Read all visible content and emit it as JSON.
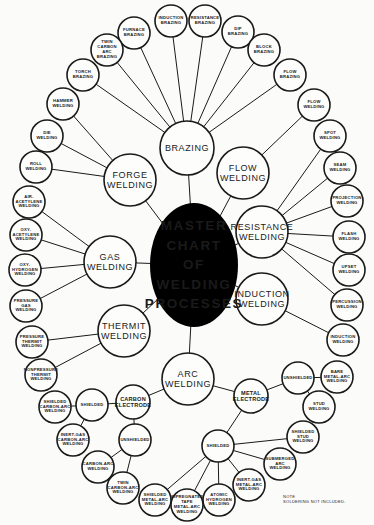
{
  "title": "MASTER\nCHART\nOF\nWELDING\nPROCESSES",
  "note": "NOTE\n   SOLDERING NOT INCLUDED.",
  "nodes": [
    {
      "id": "center",
      "label": "MASTER\nCHART\nOF\nWELDING\nPROCESSES",
      "x": 194,
      "y": 265,
      "rx": 44,
      "ry": 62,
      "type": "center"
    },
    {
      "id": "brazing",
      "label": "BRAZING",
      "x": 187,
      "y": 148,
      "r": 27,
      "type": "mid"
    },
    {
      "id": "forge",
      "label": "FORGE\nWELDING",
      "x": 130,
      "y": 180,
      "r": 26,
      "type": "mid"
    },
    {
      "id": "flow",
      "label": "FLOW\nWELDING",
      "x": 243,
      "y": 173,
      "r": 26,
      "type": "mid"
    },
    {
      "id": "gas",
      "label": "GAS\nWELDING",
      "x": 110,
      "y": 262,
      "r": 26,
      "type": "mid"
    },
    {
      "id": "resistance",
      "label": "RESISTANCE\nWELDING",
      "x": 262,
      "y": 232,
      "r": 26,
      "type": "mid"
    },
    {
      "id": "thermit",
      "label": "THERMIT\nWELDING",
      "x": 124,
      "y": 331,
      "r": 26,
      "type": "mid"
    },
    {
      "id": "induction",
      "label": "INDUCTION\nWELDING",
      "x": 262,
      "y": 299,
      "r": 26,
      "type": "mid"
    },
    {
      "id": "arc",
      "label": "ARC\nWELDING",
      "x": 188,
      "y": 379,
      "r": 26,
      "type": "mid"
    },
    {
      "id": "carbon_electrode",
      "label": "CARBON\nELECTRODE",
      "x": 133,
      "y": 402,
      "r": 17,
      "type": "small_mid"
    },
    {
      "id": "metal_electrode",
      "label": "METAL\nELECTRODE",
      "x": 251,
      "y": 396,
      "r": 17,
      "type": "small_mid"
    },
    {
      "id": "furnace_brazing",
      "label": "FURNACE\nBRAZING",
      "x": 134,
      "y": 33,
      "r": 16,
      "type": "leaf"
    },
    {
      "id": "induction_brazing",
      "label": "INDUCTION\nBRAZING",
      "x": 171,
      "y": 21,
      "r": 16,
      "type": "leaf"
    },
    {
      "id": "resistance_brazing",
      "label": "RESISTANCE\nBRAZING",
      "x": 205,
      "y": 21,
      "r": 16,
      "type": "leaf"
    },
    {
      "id": "dip_brazing",
      "label": "DIP\nBRAZING",
      "x": 238,
      "y": 32,
      "r": 16,
      "type": "leaf"
    },
    {
      "id": "block_brazing",
      "label": "BLOCK\nBRAZING",
      "x": 264,
      "y": 50,
      "r": 16,
      "type": "leaf"
    },
    {
      "id": "flow_brazing",
      "label": "FLOW\nBRAZING",
      "x": 290,
      "y": 75,
      "r": 16,
      "type": "leaf"
    },
    {
      "id": "twin_carbon_arc_brazing",
      "label": "TWIN CARBON\nARC\nBRAZING",
      "x": 107,
      "y": 50,
      "r": 16,
      "type": "leaf"
    },
    {
      "id": "torch_brazing",
      "label": "TORCH\nBRAZING",
      "x": 83,
      "y": 75,
      "r": 16,
      "type": "leaf"
    },
    {
      "id": "hammer_welding",
      "label": "HAMMER\nWELDING",
      "x": 63,
      "y": 104,
      "r": 16,
      "type": "leaf"
    },
    {
      "id": "die_welding",
      "label": "DIE\nWELDING",
      "x": 47,
      "y": 136,
      "r": 16,
      "type": "leaf"
    },
    {
      "id": "roll_welding",
      "label": "ROLL\nWELDING",
      "x": 36,
      "y": 167,
      "r": 16,
      "type": "leaf"
    },
    {
      "id": "air_acetylene_welding",
      "label": "AIR-\nACETYLENE\nWELDING",
      "x": 29,
      "y": 202,
      "r": 16,
      "type": "leaf"
    },
    {
      "id": "oxy_acetylene_welding",
      "label": "OXY-\nACETYLENE\nWELDING",
      "x": 26,
      "y": 235,
      "r": 16,
      "type": "leaf"
    },
    {
      "id": "oxy_hydrogen_welding",
      "label": "OXY-\nHYDROGEN\nWELDING",
      "x": 25,
      "y": 270,
      "r": 16,
      "type": "leaf"
    },
    {
      "id": "pressure_gas_welding",
      "label": "PRESSURE\nGAS\nWELDING",
      "x": 26,
      "y": 306,
      "r": 16,
      "type": "leaf"
    },
    {
      "id": "pressure_thermit_welding",
      "label": "PRESSURE\nTHERMIT\nWELDING",
      "x": 32,
      "y": 342,
      "r": 16,
      "type": "leaf"
    },
    {
      "id": "nonpressure_thermit_welding",
      "label": "NONPRESSURE\nTHERMIT\nWELDING",
      "x": 41,
      "y": 375,
      "r": 16,
      "type": "leaf"
    },
    {
      "id": "flow_welding_leaf",
      "label": "FLOW\nWELDING",
      "x": 314,
      "y": 105,
      "r": 16,
      "type": "leaf"
    },
    {
      "id": "spot_welding",
      "label": "SPOT\nWELDING",
      "x": 330,
      "y": 136,
      "r": 16,
      "type": "leaf"
    },
    {
      "id": "seam_welding",
      "label": "SEAM\nWELDING",
      "x": 340,
      "y": 168,
      "r": 16,
      "type": "leaf"
    },
    {
      "id": "projection_welding",
      "label": "PROJECTION\nWELDING",
      "x": 347,
      "y": 201,
      "r": 16,
      "type": "leaf"
    },
    {
      "id": "flash_welding",
      "label": "FLASH\nWELDING",
      "x": 349,
      "y": 237,
      "r": 16,
      "type": "leaf"
    },
    {
      "id": "upset_welding",
      "label": "UPSET\nWELDING",
      "x": 349,
      "y": 270,
      "r": 16,
      "type": "leaf"
    },
    {
      "id": "percussion_welding",
      "label": "PERCUSSION\nWELDING",
      "x": 347,
      "y": 305,
      "r": 16,
      "type": "leaf"
    },
    {
      "id": "induction_welding_leaf",
      "label": "INDUCTION\nWELDING",
      "x": 343,
      "y": 340,
      "r": 16,
      "type": "leaf"
    },
    {
      "id": "unshielded_metal",
      "label": "UNSHIELDED",
      "x": 298,
      "y": 378,
      "r": 16,
      "type": "leaf"
    },
    {
      "id": "bare_metal_arc_welding",
      "label": "BARE\nMETAL-ARC\nWELDING",
      "x": 337,
      "y": 377,
      "r": 16,
      "type": "leaf"
    },
    {
      "id": "stud_welding",
      "label": "STUD\nWELDING",
      "x": 319,
      "y": 407,
      "r": 16,
      "type": "leaf"
    },
    {
      "id": "shielded_metal",
      "label": "SHIELDED",
      "x": 218,
      "y": 446,
      "r": 16,
      "type": "leaf"
    },
    {
      "id": "shielded_stud_welding",
      "label": "SHIELDED\nSTUD\nWELDING",
      "x": 303,
      "y": 437,
      "r": 16,
      "type": "leaf"
    },
    {
      "id": "submerged_arc_welding",
      "label": "SUBMERGED\nARC\nWELDING",
      "x": 280,
      "y": 464,
      "r": 16,
      "type": "leaf"
    },
    {
      "id": "inert_gas_metal_arc_welding",
      "label": "INERT-GAS\nMETAL-ARC\nWELDING",
      "x": 249,
      "y": 485,
      "r": 16,
      "type": "leaf"
    },
    {
      "id": "atomic_hydrogen_welding",
      "label": "ATOMIC\nHYDROGEN\nWELDING",
      "x": 219,
      "y": 500,
      "r": 16,
      "type": "leaf"
    },
    {
      "id": "impregnated_tape_metal_arc_welding",
      "label": "IMPREGNATED\nTAPE\nMETAL-ARC\nWELDING",
      "x": 187,
      "y": 505,
      "r": 16,
      "type": "leaf"
    },
    {
      "id": "shielded_metal_arc_welding",
      "label": "SHIELDED\nMETAL-ARC\nWELDING",
      "x": 155,
      "y": 500,
      "r": 16,
      "type": "leaf"
    },
    {
      "id": "shielded_carbon",
      "label": "SHIELDED",
      "x": 92,
      "y": 405,
      "r": 16,
      "type": "leaf"
    },
    {
      "id": "shielded_carbon_arc_welding",
      "label": "SHIELDED\nCARBON-ARC\nWELDING",
      "x": 55,
      "y": 407,
      "r": 16,
      "type": "leaf"
    },
    {
      "id": "inert_gas_carbon_arc_welding",
      "label": "INERT-GAS\nCARBON-ARC\nWELDING",
      "x": 73,
      "y": 440,
      "r": 16,
      "type": "leaf"
    },
    {
      "id": "unshielded_carbon",
      "label": "UNSHIELDED",
      "x": 135,
      "y": 440,
      "r": 16,
      "type": "leaf"
    },
    {
      "id": "carbon_arc_welding",
      "label": "CARBON-ARC\nWELDING",
      "x": 98,
      "y": 467,
      "r": 16,
      "type": "leaf"
    },
    {
      "id": "twin_carbon_arc_welding",
      "label": "TWIN\nCARBON-ARC\nWELDING",
      "x": 123,
      "y": 488,
      "r": 16,
      "type": "leaf"
    }
  ],
  "edges": [
    [
      "center",
      "brazing"
    ],
    [
      "center",
      "forge"
    ],
    [
      "center",
      "flow"
    ],
    [
      "center",
      "gas"
    ],
    [
      "center",
      "resistance"
    ],
    [
      "center",
      "thermit"
    ],
    [
      "center",
      "induction"
    ],
    [
      "center",
      "arc"
    ],
    [
      "brazing",
      "furnace_brazing"
    ],
    [
      "brazing",
      "induction_brazing"
    ],
    [
      "brazing",
      "resistance_brazing"
    ],
    [
      "brazing",
      "dip_brazing"
    ],
    [
      "brazing",
      "block_brazing"
    ],
    [
      "brazing",
      "flow_brazing"
    ],
    [
      "brazing",
      "twin_carbon_arc_brazing"
    ],
    [
      "brazing",
      "torch_brazing"
    ],
    [
      "forge",
      "hammer_welding"
    ],
    [
      "forge",
      "die_welding"
    ],
    [
      "forge",
      "roll_welding"
    ],
    [
      "gas",
      "air_acetylene_welding"
    ],
    [
      "gas",
      "oxy_acetylene_welding"
    ],
    [
      "gas",
      "oxy_hydrogen_welding"
    ],
    [
      "gas",
      "pressure_gas_welding"
    ],
    [
      "thermit",
      "pressure_thermit_welding"
    ],
    [
      "thermit",
      "nonpressure_thermit_welding"
    ],
    [
      "flow",
      "flow_welding_leaf"
    ],
    [
      "resistance",
      "spot_welding"
    ],
    [
      "resistance",
      "seam_welding"
    ],
    [
      "resistance",
      "projection_welding"
    ],
    [
      "resistance",
      "flash_welding"
    ],
    [
      "resistance",
      "upset_welding"
    ],
    [
      "resistance",
      "percussion_welding"
    ],
    [
      "induction",
      "induction_welding_leaf"
    ],
    [
      "arc",
      "carbon_electrode"
    ],
    [
      "arc",
      "metal_electrode"
    ],
    [
      "metal_electrode",
      "unshielded_metal"
    ],
    [
      "metal_electrode",
      "shielded_metal"
    ],
    [
      "unshielded_metal",
      "bare_metal_arc_welding"
    ],
    [
      "unshielded_metal",
      "stud_welding"
    ],
    [
      "shielded_metal",
      "shielded_stud_welding"
    ],
    [
      "shielded_metal",
      "submerged_arc_welding"
    ],
    [
      "shielded_metal",
      "inert_gas_metal_arc_welding"
    ],
    [
      "shielded_metal",
      "atomic_hydrogen_welding"
    ],
    [
      "shielded_metal",
      "impregnated_tape_metal_arc_welding"
    ],
    [
      "shielded_metal",
      "shielded_metal_arc_welding"
    ],
    [
      "carbon_electrode",
      "shielded_carbon"
    ],
    [
      "carbon_electrode",
      "unshielded_carbon"
    ],
    [
      "shielded_carbon",
      "shielded_carbon_arc_welding"
    ],
    [
      "shielded_carbon",
      "inert_gas_carbon_arc_welding"
    ],
    [
      "unshielded_carbon",
      "carbon_arc_welding"
    ],
    [
      "unshielded_carbon",
      "twin_carbon_arc_welding"
    ]
  ]
}
